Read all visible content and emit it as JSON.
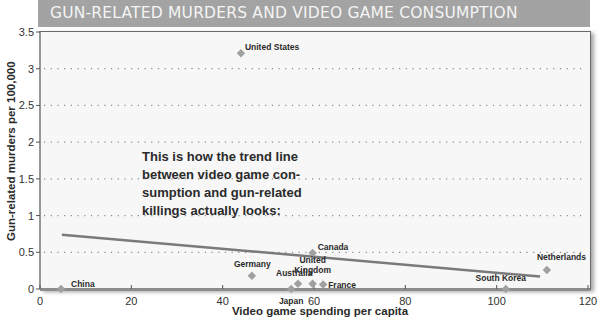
{
  "header": {
    "title": "GUN-RELATED MURDERS AND VIDEO GAME CONSUMPTION"
  },
  "annotation": {
    "lines": [
      "This is how the trend line",
      "between video game con-",
      "sumption and gun-related",
      "killings actually looks:"
    ]
  },
  "colors": {
    "header_bg": "#a3a3a3",
    "point": "#a0a0a0",
    "trend": "#7a7a7a",
    "plot_bg": "#f7f7f7"
  },
  "chart_data": {
    "type": "scatter",
    "title": "GUN-RELATED MURDERS AND VIDEO GAME CONSUMPTION",
    "xlabel": "Video game spending per capita",
    "ylabel": "Gun-related murders per 100,000",
    "xlim": [
      0,
      120
    ],
    "ylim": [
      0,
      3.5
    ],
    "xticks": [
      0,
      20,
      40,
      60,
      80,
      100,
      120
    ],
    "yticks": [
      0,
      0.5,
      1,
      1.5,
      2,
      2.5,
      3,
      3.5
    ],
    "ytick_labels": [
      "0",
      "0.5",
      "1",
      "1.5",
      "2",
      "2.5",
      "3",
      "3.5"
    ],
    "grid": "horizontal dotted",
    "points": [
      {
        "label": "United States",
        "x": 44,
        "y": 3.21
      },
      {
        "label": "Canada",
        "x": 59.7,
        "y": 0.49
      },
      {
        "label": "Germany",
        "x": 46.4,
        "y": 0.18
      },
      {
        "label": "Australia",
        "x": 56.5,
        "y": 0.07
      },
      {
        "label": "United Kingdom",
        "x": 59.7,
        "y": 0.07
      },
      {
        "label": "France",
        "x": 62,
        "y": 0.06
      },
      {
        "label": "Japan",
        "x": 55,
        "y": 0.0
      },
      {
        "label": "China",
        "x": 4.6,
        "y": 0.0
      },
      {
        "label": "South Korea",
        "x": 102,
        "y": 0.0
      },
      {
        "label": "Netherlands",
        "x": 111,
        "y": 0.26
      }
    ],
    "trend_line": {
      "x1": 4.8,
      "y1": 0.74,
      "x2": 109.5,
      "y2": 0.17
    },
    "annotation": "This is how the trend line between video game consumption and gun-related killings actually looks:"
  }
}
